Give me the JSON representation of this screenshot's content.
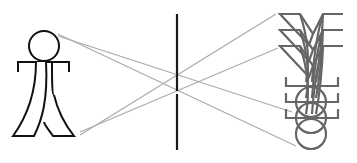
{
  "diagram": {
    "type": "pinhole-camera-optics",
    "background": "#ffffff",
    "object_figure": {
      "label": "stick-figure-person",
      "stroke": "#111111",
      "head": {
        "cx": 44,
        "cy": 46,
        "r": 15
      },
      "arms": {
        "y": 62,
        "x1": 18,
        "x2": 69,
        "drop": 10
      }
    },
    "lens": {
      "stroke": "#1a1a1a",
      "x": 177,
      "y_top": 14,
      "y_bottom": 150,
      "gap": [
        91,
        94
      ]
    },
    "rays": {
      "stroke": "#aaaaaa",
      "lines": [
        {
          "x1": 58,
          "y1": 34,
          "x2": 296,
          "y2": 146
        },
        {
          "x1": 58,
          "y1": 36,
          "x2": 292,
          "y2": 112
        },
        {
          "x1": 80,
          "y1": 135,
          "x2": 276,
          "y2": 14
        },
        {
          "x1": 80,
          "y1": 132,
          "x2": 278,
          "y2": 48
        }
      ]
    },
    "image_figures": {
      "label": "inverted-blurred-images",
      "stroke": "#666666",
      "count": 3,
      "offsets_y": [
        0,
        16,
        32
      ]
    }
  }
}
